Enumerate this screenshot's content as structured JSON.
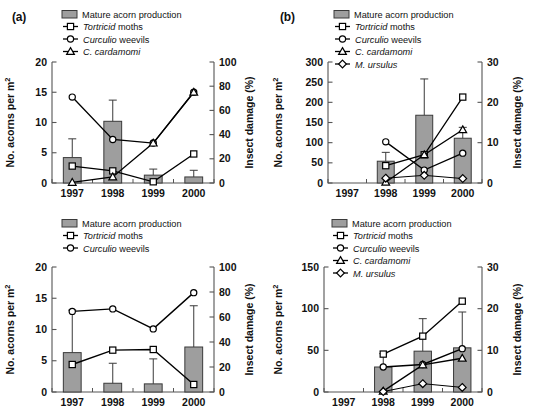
{
  "figure": {
    "background": "#ffffff",
    "bar_color": "#9e9e9e",
    "bar_edge_color": "#3a3a3a",
    "line_color": "#000000",
    "marker_fill": "#ffffff",
    "axis_color": "#555555",
    "panel_labels": {
      "a": "(a)",
      "b": "(b)"
    }
  },
  "legend_common": {
    "bar_label": "Mature acorn production",
    "tortricid": "Tortricid",
    "tortricid_rest": " moths",
    "curculio": "Curculio",
    "curculio_rest": " weevils",
    "cardamomi": "C. cardamomi",
    "ursulus": "M. ursulus"
  },
  "axis_titles": {
    "left": "No. acorns per m",
    "left_sup": "2",
    "right": "Insect damage (%)"
  },
  "chart_data": [
    {
      "id": "panel-a",
      "type": "bar",
      "panel_label": "(a)",
      "title": "",
      "xlabel": "",
      "ylabel": "No. acorns per m2",
      "y2label": "Insect damage (%)",
      "categories": [
        "1997",
        "1998",
        "1999",
        "2000"
      ],
      "ylim": [
        0,
        20
      ],
      "yticks": [
        0,
        5,
        10,
        15,
        20
      ],
      "y2lim": [
        0,
        100
      ],
      "y2ticks": [
        0,
        20,
        40,
        60,
        80,
        100
      ],
      "grid": false,
      "legend_position": "top-center",
      "bars": {
        "name": "Mature acorn production",
        "values": [
          4.2,
          10.2,
          1.3,
          1.0
        ],
        "errors_upper": [
          7.3,
          13.7,
          2.3,
          2.1
        ]
      },
      "series": [
        {
          "name": "Tortricid moths",
          "marker": "square",
          "axis": "right",
          "values": [
            14.0,
            10.0,
            1.0,
            24.0
          ]
        },
        {
          "name": "Curculio weevils",
          "marker": "circle",
          "axis": "right",
          "values": [
            71.0,
            36.0,
            33.0,
            75.0
          ]
        },
        {
          "name": "C. cardamomi",
          "marker": "triangle",
          "axis": "right",
          "values": [
            0.5,
            5.0,
            33.0,
            75.0
          ]
        }
      ]
    },
    {
      "id": "panel-b",
      "type": "bar",
      "panel_label": "(b)",
      "title": "",
      "xlabel": "",
      "ylabel": "No. acorns per m2",
      "y2label": "Insect damage (%)",
      "categories": [
        "1997",
        "1998",
        "1999",
        "2000"
      ],
      "ylim": [
        0,
        300
      ],
      "yticks": [
        0,
        50,
        100,
        150,
        200,
        250,
        300
      ],
      "y2lim": [
        0,
        30
      ],
      "y2ticks": [
        0,
        10,
        20,
        30
      ],
      "grid": false,
      "legend_position": "top-center",
      "bars": {
        "name": "Mature acorn production",
        "values": [
          null,
          54,
          168,
          111
        ],
        "errors_upper": [
          null,
          76,
          258,
          138
        ]
      },
      "series": [
        {
          "name": "Tortricid moths",
          "marker": "square",
          "axis": "right",
          "values": [
            null,
            4.3,
            7.0,
            21.3
          ]
        },
        {
          "name": "Curculio weevils",
          "marker": "circle",
          "axis": "right",
          "values": [
            null,
            10.2,
            3.2,
            7.4
          ]
        },
        {
          "name": "C. cardamomi",
          "marker": "triangle",
          "axis": "right",
          "values": [
            null,
            0.2,
            7.0,
            13.2
          ]
        },
        {
          "name": "M. ursulus",
          "marker": "diamond",
          "axis": "right",
          "values": [
            null,
            1.2,
            1.9,
            1.1
          ]
        }
      ]
    },
    {
      "id": "panel-c",
      "type": "bar",
      "panel_label": "",
      "title": "",
      "xlabel": "",
      "ylabel": "No. acorns per m2",
      "y2label": "Insect damage (%)",
      "categories": [
        "1997",
        "1998",
        "1999",
        "2000"
      ],
      "ylim": [
        0,
        20
      ],
      "yticks": [
        0,
        5,
        10,
        15,
        20
      ],
      "y2lim": [
        0,
        100
      ],
      "y2ticks": [
        0,
        20,
        40,
        60,
        80,
        100
      ],
      "grid": false,
      "legend_position": "top-center",
      "bars": {
        "name": "Mature acorn production",
        "values": [
          6.3,
          1.4,
          1.3,
          7.2
        ],
        "errors_upper": [
          13.1,
          4.6,
          5.3,
          13.8
        ]
      },
      "series": [
        {
          "name": "Tortricid moths",
          "marker": "square",
          "axis": "right",
          "values": [
            22.0,
            33.5,
            34.0,
            6.0
          ]
        },
        {
          "name": "Curculio weevils",
          "marker": "circle",
          "axis": "right",
          "values": [
            64.5,
            66.5,
            50.5,
            79.5
          ]
        }
      ]
    },
    {
      "id": "panel-d",
      "type": "bar",
      "panel_label": "",
      "title": "",
      "xlabel": "",
      "ylabel": "No. acorns per m2",
      "y2label": "Insect damage (%)",
      "categories": [
        "1997",
        "1998",
        "1999",
        "2000"
      ],
      "ylim": [
        0,
        150
      ],
      "yticks": [
        0,
        50,
        100,
        150
      ],
      "y2lim": [
        0,
        30
      ],
      "y2ticks": [
        0,
        10,
        20,
        30
      ],
      "grid": false,
      "legend_position": "top-center",
      "bars": {
        "name": "Mature acorn production",
        "values": [
          null,
          30,
          49,
          53
        ],
        "errors_upper": [
          null,
          46,
          88,
          96
        ]
      },
      "series": [
        {
          "name": "Tortricid moths",
          "marker": "square",
          "axis": "right",
          "values": [
            null,
            9.1,
            13.4,
            21.8
          ]
        },
        {
          "name": "Curculio weevils",
          "marker": "circle",
          "axis": "right",
          "values": [
            null,
            6.0,
            6.6,
            10.4
          ]
        },
        {
          "name": "C. cardamomi",
          "marker": "triangle",
          "axis": "right",
          "values": [
            null,
            0.2,
            6.5,
            8.1
          ]
        },
        {
          "name": "M. ursulus",
          "marker": "diamond",
          "axis": "right",
          "values": [
            null,
            0.1,
            2.0,
            1.1
          ]
        }
      ]
    }
  ]
}
